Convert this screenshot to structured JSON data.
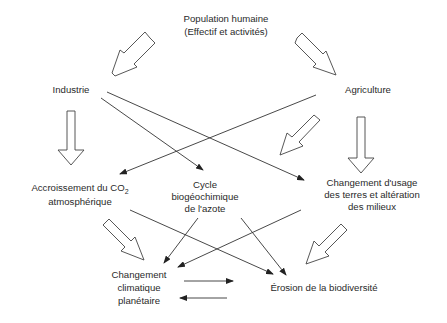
{
  "diagram": {
    "nodes": {
      "population": {
        "line1": "Population humaine",
        "line2": "(Effectif et activités)"
      },
      "industrie": {
        "label": "Industrie"
      },
      "agriculture": {
        "label": "Agriculture"
      },
      "co2": {
        "line1_pre": "Accroissement du CO",
        "line1_sub": "2",
        "line2": "atmosphérique"
      },
      "azote": {
        "line1": "Cycle",
        "line2": "biogéochimique",
        "line3": "de l'azote"
      },
      "terres": {
        "line1": "Changement d'usage",
        "line2": "des terres et altération",
        "line3": "des milieux"
      },
      "climat": {
        "line1": "Changement",
        "line2": "climatique",
        "line3": "planétaire"
      },
      "biodiversite": {
        "label": "Érosion de la biodiversité"
      }
    },
    "edges": [
      {
        "from": "population",
        "to": "industrie",
        "style": "hollow-arrow"
      },
      {
        "from": "population",
        "to": "agriculture",
        "style": "hollow-arrow"
      },
      {
        "from": "industrie",
        "to": "co2",
        "style": "hollow-arrow"
      },
      {
        "from": "industrie",
        "to": "azote",
        "style": "line-arrow"
      },
      {
        "from": "industrie",
        "to": "terres",
        "style": "line-arrow"
      },
      {
        "from": "agriculture",
        "to": "co2",
        "style": "line-arrow"
      },
      {
        "from": "agriculture",
        "to": "azote",
        "style": "hollow-arrow"
      },
      {
        "from": "agriculture",
        "to": "terres",
        "style": "hollow-arrow"
      },
      {
        "from": "co2",
        "to": "climat",
        "style": "hollow-arrow"
      },
      {
        "from": "co2",
        "to": "biodiversite",
        "style": "line-arrow"
      },
      {
        "from": "azote",
        "to": "climat",
        "style": "line-arrow"
      },
      {
        "from": "azote",
        "to": "biodiversite",
        "style": "line-arrow"
      },
      {
        "from": "terres",
        "to": "climat",
        "style": "line-arrow"
      },
      {
        "from": "terres",
        "to": "biodiversite",
        "style": "hollow-arrow"
      },
      {
        "from": "climat",
        "to": "biodiversite",
        "style": "line-arrow"
      },
      {
        "from": "biodiversite",
        "to": "climat",
        "style": "line-arrow"
      }
    ]
  }
}
